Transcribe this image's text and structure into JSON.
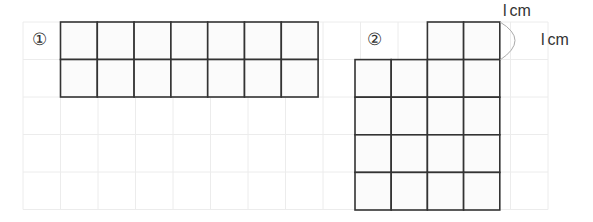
{
  "figure": {
    "cell_size_cm": 1,
    "grid": {
      "cols": 14,
      "rows": 5
    },
    "shapes": [
      {
        "id": "1",
        "marker": "①",
        "cells": [
          [
            0,
            0
          ],
          [
            1,
            0
          ],
          [
            2,
            0
          ],
          [
            3,
            0
          ],
          [
            4,
            0
          ],
          [
            5,
            0
          ],
          [
            6,
            0
          ],
          [
            0,
            1
          ],
          [
            1,
            1
          ],
          [
            2,
            1
          ],
          [
            3,
            1
          ],
          [
            4,
            1
          ],
          [
            5,
            1
          ],
          [
            6,
            1
          ]
        ]
      },
      {
        "id": "2",
        "marker": "②",
        "cells": [
          [
            2,
            0
          ],
          [
            3,
            0
          ],
          [
            0,
            1
          ],
          [
            1,
            1
          ],
          [
            2,
            1
          ],
          [
            3,
            1
          ],
          [
            0,
            2
          ],
          [
            1,
            2
          ],
          [
            2,
            2
          ],
          [
            3,
            2
          ],
          [
            0,
            3
          ],
          [
            1,
            3
          ],
          [
            2,
            3
          ],
          [
            3,
            3
          ],
          [
            0,
            4
          ],
          [
            1,
            4
          ],
          [
            2,
            4
          ],
          [
            3,
            4
          ]
        ]
      }
    ],
    "scale_labels": {
      "horizontal": "1 cm",
      "vertical": "1 cm"
    },
    "scale_text": {
      "h_digit": "l",
      "h_unit": "cm",
      "v_digit": "l",
      "v_unit": "cm"
    }
  }
}
